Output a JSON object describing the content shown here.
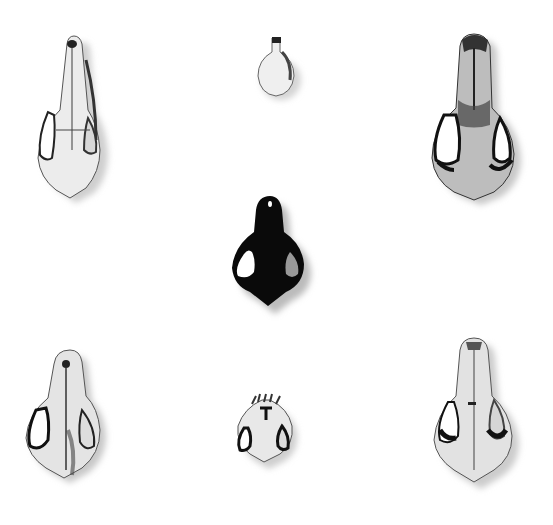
{
  "scene": {
    "description": "Black-and-white photograph of seven animal skulls in dorsal view arranged on a white background",
    "background": "#ffffff",
    "skulls": [
      {
        "position": "top-left",
        "shade": "light",
        "size": "large"
      },
      {
        "position": "top-center",
        "shade": "light",
        "size": "small"
      },
      {
        "position": "top-right",
        "shade": "mid-grey",
        "size": "large"
      },
      {
        "position": "middle-center",
        "shade": "black",
        "size": "medium"
      },
      {
        "position": "bottom-left",
        "shade": "light",
        "size": "large"
      },
      {
        "position": "bottom-center",
        "shade": "light",
        "size": "small"
      },
      {
        "position": "bottom-right",
        "shade": "light",
        "size": "large"
      }
    ]
  }
}
